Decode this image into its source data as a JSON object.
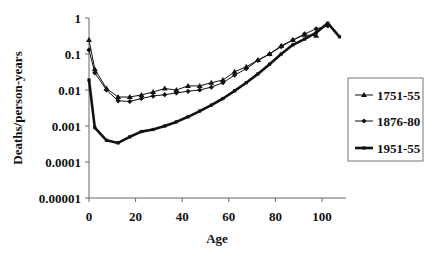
{
  "chart_data": {
    "type": "line",
    "title": "",
    "xlabel": "Age",
    "ylabel": "Deaths/person-years",
    "yscale": "log",
    "xlim": [
      0,
      110
    ],
    "ylim": [
      1e-05,
      1
    ],
    "x_ticks": [
      "0",
      "20",
      "40",
      "60",
      "80",
      "100"
    ],
    "x_tick_values": [
      0,
      20,
      40,
      60,
      80,
      100
    ],
    "y_ticks": [
      "1",
      "0.1",
      "0.01",
      "0.001",
      "0.0001",
      "0.00001"
    ],
    "y_tick_values": [
      1,
      0.1,
      0.01,
      0.001,
      0.0001,
      1e-05
    ],
    "grid": false,
    "legend_position": "right",
    "series": [
      {
        "name": "1751-55",
        "marker": "triangle",
        "line_width": 1,
        "color": "#111111",
        "x": [
          0,
          2.5,
          7.5,
          12.5,
          17.5,
          22.5,
          27.5,
          32.5,
          37.5,
          42.5,
          47.5,
          52.5,
          57.5,
          62.5,
          67.5,
          72.5,
          77.5,
          82.5,
          87.5,
          92.5,
          97.5
        ],
        "values": [
          0.245,
          0.038,
          0.011,
          0.0064,
          0.0064,
          0.0073,
          0.0088,
          0.011,
          0.01,
          0.013,
          0.013,
          0.016,
          0.019,
          0.032,
          0.044,
          0.068,
          0.1,
          0.17,
          0.245,
          0.34,
          0.32
        ]
      },
      {
        "name": "1876-80",
        "marker": "diamond",
        "line_width": 1,
        "color": "#111111",
        "x": [
          0,
          2.5,
          7.5,
          12.5,
          17.5,
          22.5,
          27.5,
          32.5,
          37.5,
          42.5,
          47.5,
          52.5,
          57.5,
          62.5,
          67.5,
          72.5,
          77.5,
          82.5,
          87.5,
          92.5,
          97.5,
          102.5
        ],
        "values": [
          0.13,
          0.03,
          0.01,
          0.005,
          0.0048,
          0.0058,
          0.0068,
          0.0074,
          0.0083,
          0.0092,
          0.01,
          0.012,
          0.016,
          0.026,
          0.039,
          0.066,
          0.1,
          0.16,
          0.245,
          0.36,
          0.5,
          0.6
        ]
      },
      {
        "name": "1951-55",
        "marker": "square",
        "line_width": 2.6,
        "color": "#111111",
        "x": [
          0,
          2.5,
          7.5,
          12.5,
          17.5,
          22.5,
          27.5,
          32.5,
          37.5,
          42.5,
          47.5,
          52.5,
          57.5,
          62.5,
          67.5,
          72.5,
          77.5,
          82.5,
          87.5,
          92.5,
          97.5,
          102.5,
          107.5
        ],
        "values": [
          0.019,
          0.0009,
          0.0004,
          0.00034,
          0.0005,
          0.0007,
          0.0008,
          0.001,
          0.0013,
          0.0018,
          0.0026,
          0.0038,
          0.0058,
          0.0095,
          0.016,
          0.028,
          0.052,
          0.1,
          0.18,
          0.26,
          0.39,
          0.72,
          0.3
        ]
      }
    ]
  }
}
